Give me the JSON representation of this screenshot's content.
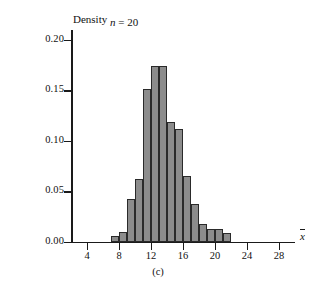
{
  "figure": {
    "caption": "(c)",
    "annotation_n": "n = 20",
    "annotation_n_symbol": "n",
    "annotation_n_value": "= 20"
  },
  "axes": {
    "y_title": "Density",
    "x_title_symbol": "x",
    "y_ticklabels": [
      "0.00",
      "0.05",
      "0.10",
      "0.15",
      "0.20"
    ],
    "x_ticklabels": [
      "4",
      "8",
      "12",
      "16",
      "20",
      "24",
      "28"
    ]
  },
  "colors": {
    "bar_fill": "#8c8c8c",
    "bar_edge": "#2a2a2a",
    "axis": "#1a1a1a",
    "background": "#ffffff"
  },
  "chart_data": {
    "type": "bar",
    "title": "",
    "subtitle": "n = 20",
    "xlabel": "x̄",
    "ylabel": "Density",
    "xlim": [
      2,
      30
    ],
    "ylim": [
      0.0,
      0.21
    ],
    "xticks": [
      4,
      8,
      12,
      16,
      20,
      24,
      28
    ],
    "yticks": [
      0.0,
      0.05,
      0.1,
      0.15,
      0.2
    ],
    "grid": false,
    "legend": null,
    "bin_width": 1,
    "bin_edges": [
      7,
      8,
      9,
      10,
      11,
      12,
      13,
      14,
      15,
      16,
      17,
      18,
      19,
      20,
      21,
      22
    ],
    "categories": [
      "7-8",
      "8-9",
      "9-10",
      "10-11",
      "11-12",
      "12-13",
      "13-14",
      "14-15",
      "15-16",
      "16-17",
      "17-18",
      "18-19",
      "19-20",
      "20-21",
      "21-22"
    ],
    "values": [
      0.005,
      0.009,
      0.042,
      0.062,
      0.151,
      0.174,
      0.174,
      0.119,
      0.112,
      0.065,
      0.037,
      0.017,
      0.012,
      0.012,
      0.008
    ]
  }
}
